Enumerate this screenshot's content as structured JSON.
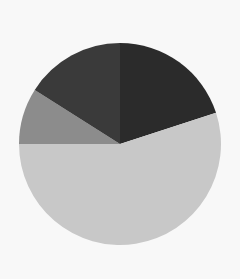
{
  "chart_data": {
    "type": "pie",
    "title": "",
    "start_angle_deg": 0,
    "direction": "clockwise",
    "legend": "none",
    "labels_shown": false,
    "slices": [
      {
        "name": "slice-1",
        "value": 20,
        "color": "#2b2b2b"
      },
      {
        "name": "slice-2",
        "value": 55,
        "color": "#c8c8c8"
      },
      {
        "name": "slice-3",
        "value": 9,
        "color": "#8c8c8c"
      },
      {
        "name": "slice-4",
        "value": 16,
        "color": "#3a3a3a"
      }
    ],
    "values": [
      20,
      55,
      9,
      16
    ],
    "center": [
      120,
      144
    ],
    "radius": 101
  },
  "colors": {
    "background": "#f8f8f8"
  }
}
